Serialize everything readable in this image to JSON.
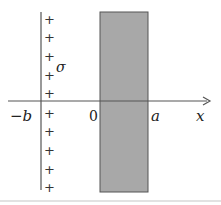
{
  "diagram": {
    "title": "",
    "colors": {
      "slab_fill": "#a8a8a8",
      "slab_edge": "#555555",
      "line": "#555555",
      "text": "#222222"
    },
    "charged_plane": {
      "symbol": "σ",
      "charge_sign": "+",
      "plus_count": 10
    },
    "axis": {
      "label": "x",
      "ticks": [
        {
          "label": "−b"
        },
        {
          "label": "0"
        },
        {
          "label": "a"
        }
      ]
    },
    "slab": {
      "from": "0",
      "to": "a"
    }
  }
}
